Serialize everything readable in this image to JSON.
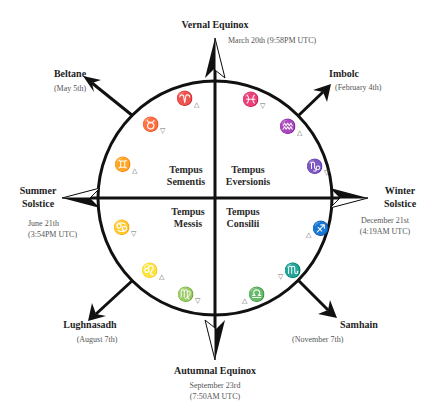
{
  "diagram": {
    "type": "wheel-of-the-year",
    "circle": {
      "cx": 215,
      "cy": 198,
      "r": 117,
      "stroke": "#111111"
    },
    "quadrants": [
      {
        "id": "tempus-sementis",
        "line1": "Tempus",
        "line2": "Sementis"
      },
      {
        "id": "tempus-eversionis",
        "line1": "Tempus",
        "line2": "Eversionis"
      },
      {
        "id": "tempus-messis",
        "line1": "Tempus",
        "line2": "Messis"
      },
      {
        "id": "tempus-consilii",
        "line1": "Tempus",
        "line2": "Consilii"
      }
    ],
    "festivals": {
      "vernal": {
        "title": "Vernal Equinox",
        "date": "March 20th (9:58PM UTC)"
      },
      "beltane": {
        "title": "Beltane",
        "date": "(May 5th)"
      },
      "imbolc": {
        "title": "Imbolc",
        "date": "(February 4th)"
      },
      "summer": {
        "title1": "Summer",
        "title2": "Solstice",
        "date1": "June 21th",
        "date2": "(3:54PM UTC)"
      },
      "winter": {
        "title1": "Winter",
        "title2": "Solstice",
        "date1": "December 21st",
        "date2": "(4:19AM UTC)"
      },
      "lughnasadh": {
        "title": "Lughnasadh",
        "date": "(August 7th)"
      },
      "samhain": {
        "title": "Samhain",
        "date": "(November 7th)"
      },
      "autumnal": {
        "title": "Autumnal Equinox",
        "date1": "September 23rd",
        "date2": "(7:50AM UTC)"
      }
    },
    "signs": {
      "aries": {
        "glyph": "♈",
        "tri": "△"
      },
      "taurus": {
        "glyph": "♉",
        "tri": "▽"
      },
      "gemini": {
        "glyph": "♊",
        "tri": "△"
      },
      "pisces": {
        "glyph": "♓",
        "tri": "▽"
      },
      "aquarius": {
        "glyph": "♒",
        "tri": "△"
      },
      "capricorn": {
        "glyph": "♑",
        "tri": "▽"
      },
      "cancer": {
        "glyph": "♋",
        "tri": "▽"
      },
      "leo": {
        "glyph": "♌",
        "tri": "△"
      },
      "virgo": {
        "glyph": "♍",
        "tri": "▽"
      },
      "sagittarius": {
        "glyph": "♐",
        "tri": "△"
      },
      "scorpio": {
        "glyph": "♏",
        "tri": "▽"
      },
      "libra": {
        "glyph": "♎",
        "tri": "△"
      }
    }
  }
}
